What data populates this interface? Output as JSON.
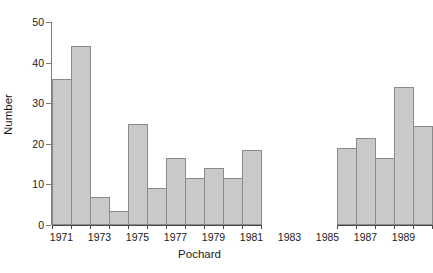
{
  "chart_data": {
    "type": "bar",
    "title": "",
    "subtitle": "",
    "xlabel": "Pochard",
    "ylabel": "Number",
    "categories": [
      "1971",
      "1972",
      "1973",
      "1974",
      "1975",
      "1976",
      "1977",
      "1978",
      "1979",
      "1980",
      "1981",
      "1982",
      "1983",
      "1984",
      "1985",
      "1986",
      "1987",
      "1988",
      "1989",
      "1990"
    ],
    "values": [
      36,
      44,
      7,
      3.5,
      25,
      9,
      16.5,
      11.5,
      14,
      11.5,
      18.5,
      null,
      null,
      null,
      null,
      19,
      21.5,
      16.5,
      34,
      24.5
    ],
    "series": [
      {
        "name": "Number",
        "values": [
          36,
          44,
          7,
          3.5,
          25,
          9,
          16.5,
          11.5,
          14,
          11.5,
          18.5,
          null,
          null,
          null,
          null,
          19,
          21.5,
          16.5,
          34,
          24.5
        ]
      }
    ],
    "ylim": [
      0,
      50
    ],
    "yticks": [
      0,
      10,
      20,
      30,
      40,
      50
    ],
    "ytick_labels": [
      "0",
      "10",
      "20",
      "30",
      "40",
      "50"
    ],
    "xtick_labels": [
      "1971",
      "1973",
      "1975",
      "1977",
      "1979",
      "1981",
      "1983",
      "1985",
      "1987",
      "1989"
    ],
    "xtick_categories": [
      "1971",
      "1973",
      "1975",
      "1977",
      "1979",
      "1981",
      "1983",
      "1985",
      "1987",
      "1989"
    ],
    "grid": false,
    "legend": false,
    "legend_position": "none",
    "axis_break": {
      "present": true,
      "between": [
        "1981",
        "1986"
      ],
      "note": "x-axis line is interrupted across the missing years 1982-1985"
    },
    "missing_categories": [
      "1982",
      "1983",
      "1984",
      "1985"
    ],
    "colors": {
      "bar_fill": "#c9c9c9",
      "bar_edge": "#8a8a8a",
      "axis": "#4a4a4a",
      "text": "#1a1a1a",
      "background": "#ffffff"
    }
  }
}
